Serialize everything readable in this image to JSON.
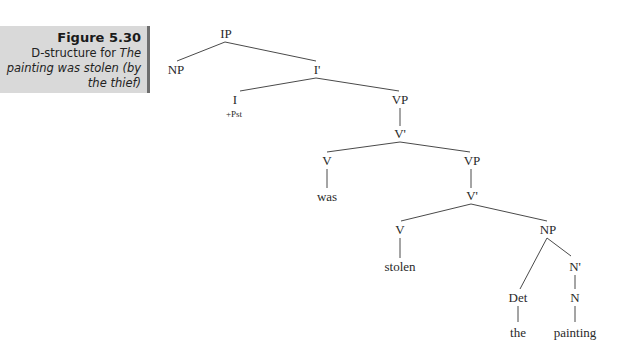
{
  "caption": {
    "figure_number": "Figure 5.30",
    "text_plain": "D-structure for ",
    "text_italic": "The painting was stolen (by the thief)"
  },
  "tree": {
    "nodes": [
      {
        "id": "IP",
        "label": "IP",
        "x": 226,
        "y": 38
      },
      {
        "id": "NP1",
        "label": "NP",
        "x": 176,
        "y": 74
      },
      {
        "id": "Ibar",
        "label": "I'",
        "x": 317,
        "y": 74
      },
      {
        "id": "I",
        "label": "I",
        "x": 235,
        "y": 104
      },
      {
        "id": "feat",
        "label": "+Pst",
        "x": 234,
        "y": 117,
        "feature": true
      },
      {
        "id": "VP1",
        "label": "VP",
        "x": 400,
        "y": 104
      },
      {
        "id": "Vbar1",
        "label": "V'",
        "x": 400,
        "y": 138
      },
      {
        "id": "V1",
        "label": "V",
        "x": 327,
        "y": 165
      },
      {
        "id": "was",
        "label": "was",
        "x": 327,
        "y": 201
      },
      {
        "id": "VP2",
        "label": "VP",
        "x": 472,
        "y": 165
      },
      {
        "id": "Vbar2",
        "label": "V'",
        "x": 472,
        "y": 200
      },
      {
        "id": "V2",
        "label": "V",
        "x": 400,
        "y": 234
      },
      {
        "id": "stolen",
        "label": "stolen",
        "x": 400,
        "y": 271
      },
      {
        "id": "NP2",
        "label": "NP",
        "x": 548,
        "y": 234
      },
      {
        "id": "Nbar",
        "label": "N'",
        "x": 575,
        "y": 271
      },
      {
        "id": "Det",
        "label": "Det",
        "x": 518,
        "y": 302
      },
      {
        "id": "N",
        "label": "N",
        "x": 575,
        "y": 302
      },
      {
        "id": "the",
        "label": "the",
        "x": 518,
        "y": 337
      },
      {
        "id": "painting",
        "label": "painting",
        "x": 575,
        "y": 337
      }
    ],
    "edges": [
      {
        "x1": 225,
        "y1": 42,
        "x2": 177,
        "y2": 61
      },
      {
        "x1": 225,
        "y1": 42,
        "x2": 316,
        "y2": 61
      },
      {
        "x1": 316,
        "y1": 78,
        "x2": 240,
        "y2": 91
      },
      {
        "x1": 316,
        "y1": 78,
        "x2": 399,
        "y2": 91
      },
      {
        "x1": 400,
        "y1": 108,
        "x2": 400,
        "y2": 126
      },
      {
        "x1": 400,
        "y1": 142,
        "x2": 327,
        "y2": 152
      },
      {
        "x1": 400,
        "y1": 142,
        "x2": 470,
        "y2": 152
      },
      {
        "x1": 327,
        "y1": 169,
        "x2": 327,
        "y2": 188
      },
      {
        "x1": 471,
        "y1": 169,
        "x2": 471,
        "y2": 188
      },
      {
        "x1": 471,
        "y1": 204,
        "x2": 401,
        "y2": 221
      },
      {
        "x1": 471,
        "y1": 204,
        "x2": 547,
        "y2": 221
      },
      {
        "x1": 400,
        "y1": 238,
        "x2": 400,
        "y2": 258
      },
      {
        "x1": 547,
        "y1": 238,
        "x2": 520,
        "y2": 289
      },
      {
        "x1": 547,
        "y1": 238,
        "x2": 571,
        "y2": 256
      },
      {
        "x1": 575,
        "y1": 275,
        "x2": 575,
        "y2": 289
      },
      {
        "x1": 518,
        "y1": 306,
        "x2": 518,
        "y2": 322
      },
      {
        "x1": 575,
        "y1": 306,
        "x2": 575,
        "y2": 322
      }
    ]
  }
}
